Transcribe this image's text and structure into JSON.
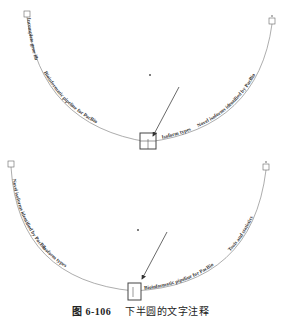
{
  "top_diagram": {
    "labels": [
      "Incomplete gene library",
      "Bioinformatic pipeline for PacBio",
      "Isoform types",
      "Novel isoforms identified by PacBio"
    ]
  },
  "bottom_diagram": {
    "labels": [
      "Novel isoforms identified by PacBio",
      "Isoform types",
      "Bioinformatic pipeline for PacBio",
      "Tools and statistics"
    ]
  },
  "caption": {
    "figure_number": "图 6-106",
    "text": "下半圆的文字注释"
  }
}
